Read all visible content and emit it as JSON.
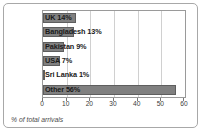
{
  "chart_data": {
    "type": "bar",
    "orientation": "horizontal",
    "title": "",
    "xlabel": "% of total arrivals",
    "ylabel": "",
    "xlim": [
      0,
      60
    ],
    "xticks": [
      0,
      10,
      20,
      30,
      40,
      50,
      60
    ],
    "grid": true,
    "legend": false,
    "categories": [
      "UK",
      "Bangladesh",
      "Pakistan",
      "USA",
      "Sri Lanka",
      "Other"
    ],
    "values": [
      14,
      13,
      9,
      7,
      1,
      56
    ],
    "data_labels": [
      "UK 14%",
      "Bangladesh 13%",
      "Pakistan 9%",
      "USA 7%",
      "Sri Lanka 1%",
      "Other 56%"
    ],
    "bar_color": "#808080",
    "bar_edge_color": "#5e5e5e",
    "grid_color": "#d0d0d0",
    "border_color": "#a8a8a8"
  }
}
